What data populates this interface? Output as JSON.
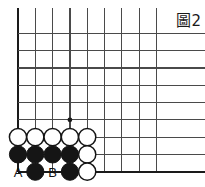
{
  "figure": {
    "label": "圖2",
    "type": "go-board-diagram"
  },
  "board": {
    "line_color": "#4a4a4a",
    "edge_color": "#1a1a1a",
    "background": "#ffffff",
    "origin_x": 18,
    "origin_y": 16,
    "spacing": 17.3,
    "cols": 9,
    "rows": 10,
    "stone_radius": 8.6,
    "star_points": [
      {
        "col": 3,
        "row": 6
      }
    ],
    "edges": {
      "left": true,
      "bottom": true,
      "top": false,
      "right": false
    }
  },
  "stones": {
    "black_color": "#151515",
    "white_fill": "#ffffff",
    "white_stroke": "#151515",
    "list": [
      {
        "col": 0,
        "row": 7,
        "color": "white"
      },
      {
        "col": 1,
        "row": 7,
        "color": "white"
      },
      {
        "col": 2,
        "row": 7,
        "color": "white"
      },
      {
        "col": 3,
        "row": 7,
        "color": "white"
      },
      {
        "col": 4,
        "row": 7,
        "color": "white"
      },
      {
        "col": 0,
        "row": 8,
        "color": "black"
      },
      {
        "col": 1,
        "row": 8,
        "color": "black"
      },
      {
        "col": 2,
        "row": 8,
        "color": "black"
      },
      {
        "col": 3,
        "row": 8,
        "color": "black"
      },
      {
        "col": 4,
        "row": 8,
        "color": "white"
      },
      {
        "col": 1,
        "row": 9,
        "color": "black"
      },
      {
        "col": 3,
        "row": 9,
        "color": "black"
      },
      {
        "col": 4,
        "row": 9,
        "color": "white"
      }
    ]
  },
  "point_labels": [
    {
      "col": 0,
      "row": 9,
      "text": "A"
    },
    {
      "col": 2,
      "row": 9,
      "text": "B"
    }
  ]
}
